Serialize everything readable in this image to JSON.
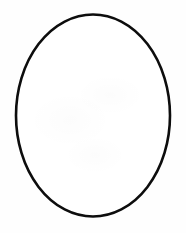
{
  "canvas": {
    "width": 186,
    "height": 233,
    "background_color": "#fefefe",
    "alt_text": "Blank white canvas with a single large black outlined vertical ellipse"
  },
  "shapes": [
    {
      "name": "ellipse-outline",
      "type": "ellipse",
      "center_x": 93,
      "center_y": 115.5,
      "radius_x": 77,
      "radius_y": 101,
      "stroke_color": "#0d0d0d",
      "stroke_width": 2.6,
      "fill_color": "#ffffff",
      "rotation_deg": 0,
      "bounds": {
        "left": 16,
        "top": 14.5,
        "right": 170,
        "bottom": 216.5
      }
    }
  ],
  "chart_data": {
    "type": "scatter",
    "title": "",
    "xlabel": "",
    "ylabel": "",
    "xlim": [
      0,
      186
    ],
    "ylim": [
      0,
      233
    ],
    "grid": false,
    "legend": "none",
    "annotations": [],
    "series": [
      {
        "name": "ellipse-outline",
        "shape": "ellipse",
        "center": [
          93,
          115.5
        ],
        "radii": [
          77,
          101
        ],
        "stroke": "#0d0d0d",
        "fill": "#ffffff"
      }
    ]
  }
}
